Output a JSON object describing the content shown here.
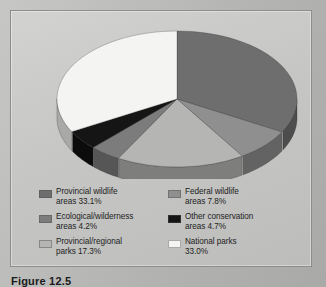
{
  "figure": {
    "caption": "Figure 12.5"
  },
  "chart_data": {
    "type": "pie",
    "title": "",
    "subtitle": "",
    "xlabel": "",
    "ylabel": "",
    "legend_position": "bottom",
    "grid": false,
    "three_d": true,
    "start_angle_deg": 0,
    "direction": "clockwise",
    "units": "percent",
    "total": 100.1,
    "categories": [
      "Provincial wildlife areas",
      "Federal wildlife areas",
      "Provincial/regional parks",
      "Ecological/wilderness areas",
      "Other conservation areas",
      "National parks"
    ],
    "values": [
      33.1,
      7.8,
      17.3,
      4.2,
      4.7,
      33.0
    ],
    "colors": [
      "#6e6e6e",
      "#8f8f8f",
      "#b5b5b3",
      "#7c7c7c",
      "#151515",
      "#f4f4f2"
    ],
    "slices": [
      {
        "label": "Provincial wildlife areas",
        "value": 33.1,
        "display": "33.1%",
        "color": "#6e6e6e",
        "side_color": "#4d4d4d"
      },
      {
        "label": "Federal wildlife areas",
        "value": 7.8,
        "display": "7.8%",
        "color": "#8f8f8f",
        "side_color": "#636363"
      },
      {
        "label": "Provincial/regional parks",
        "value": 17.3,
        "display": "17.3%",
        "color": "#b5b5b3",
        "side_color": "#7e7e7c"
      },
      {
        "label": "Ecological/wilderness areas",
        "value": 4.2,
        "display": "4.2%",
        "color": "#7c7c7c",
        "side_color": "#565656"
      },
      {
        "label": "Other conservation areas",
        "value": 4.7,
        "display": "4.7%",
        "color": "#151515",
        "side_color": "#0c0c0c"
      },
      {
        "label": "National parks",
        "value": 33.0,
        "display": "33.0%",
        "color": "#f4f4f2",
        "side_color": "#a9a9a7"
      }
    ]
  },
  "legend": {
    "entries": [
      {
        "label": "Provincial wildlife\nareas 33.1%",
        "color": "#6e6e6e",
        "name": "provincial-wildlife-areas"
      },
      {
        "label": "Federal wildlife\nareas 7.8%",
        "color": "#8f8f8f",
        "name": "federal-wildlife-areas"
      },
      {
        "label": "Ecological/wilderness\nareas 4.2%",
        "color": "#7c7c7c",
        "name": "ecological-wilderness-areas"
      },
      {
        "label": "Other conservation\nareas 4.7%",
        "color": "#151515",
        "name": "other-conservation-areas"
      },
      {
        "label": "Provincial/regional\nparks 17.3%",
        "color": "#b5b5b3",
        "name": "provincial-regional-parks"
      },
      {
        "label": "National parks\n33.0%",
        "color": "#f4f4f2",
        "name": "national-parks"
      }
    ]
  },
  "colors": {
    "page_background": "#bcbcba",
    "panel_background": "#c6c6c4",
    "panel_border": "#8d8d8b",
    "text": "#1d1d1d"
  }
}
